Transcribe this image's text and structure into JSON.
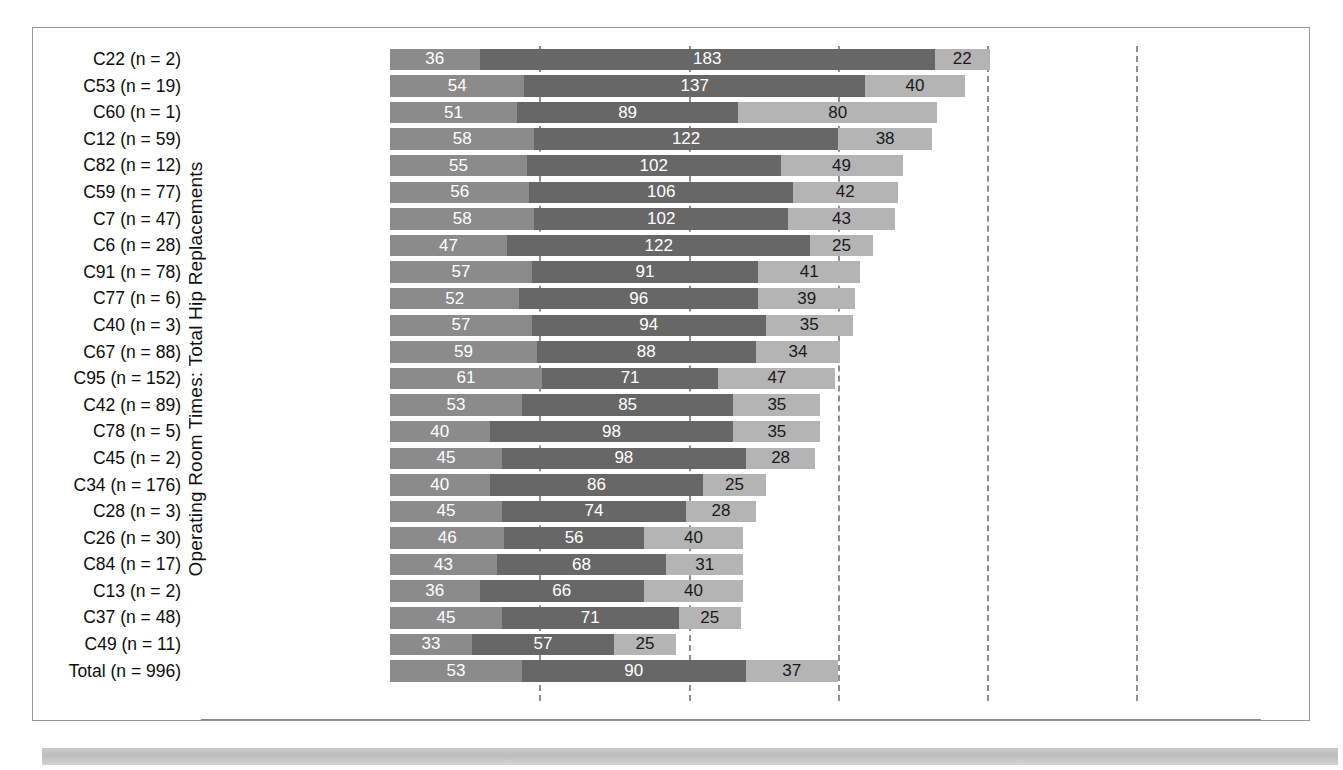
{
  "figure": {
    "axis_title": "Operating Room Times: Total Hip Replacements"
  },
  "chart_data": {
    "type": "bar",
    "orientation": "horizontal",
    "stacked": true,
    "title": "",
    "xlabel": "",
    "ylabel": "Operating Room Times: Total Hip Replacements",
    "xlim": [
      0,
      360
    ],
    "grid": true,
    "gridlines_x": [
      60,
      120,
      180,
      240,
      300
    ],
    "legend_position": "none",
    "series": [
      {
        "name": "segment-1",
        "color": "#8b8b8b"
      },
      {
        "name": "segment-2",
        "color": "#676767"
      },
      {
        "name": "segment-3",
        "color": "#b4b4b4"
      }
    ],
    "categories": [
      "C22 (n = 2)",
      "C53 (n = 19)",
      "C60 (n = 1)",
      "C12 (n = 59)",
      "C82 (n = 12)",
      "C59 (n = 77)",
      "C7 (n = 47)",
      "C6 (n = 28)",
      "C91 (n = 78)",
      "C77 (n = 6)",
      "C40 (n = 3)",
      "C67 (n = 88)",
      "C95 (n = 152)",
      "C42 (n = 89)",
      "C78 (n = 5)",
      "C45 (n = 2)",
      "C34 (n = 176)",
      "C28 (n = 3)",
      "C26 (n = 30)",
      "C84 (n = 17)",
      "C13 (n = 2)",
      "C37 (n = 48)",
      "C49 (n = 11)",
      "Total (n = 996)"
    ],
    "rows": [
      {
        "label": "C22 (n = 2)",
        "values": [
          36,
          183,
          22
        ],
        "total": 241
      },
      {
        "label": "C53 (n = 19)",
        "values": [
          54,
          137,
          40
        ],
        "total": 231
      },
      {
        "label": "C60 (n = 1)",
        "values": [
          51,
          89,
          80
        ],
        "total": 220
      },
      {
        "label": "C12 (n = 59)",
        "values": [
          58,
          122,
          38
        ],
        "total": 218
      },
      {
        "label": "C82 (n = 12)",
        "values": [
          55,
          102,
          49
        ],
        "total": 206
      },
      {
        "label": "C59 (n = 77)",
        "values": [
          56,
          106,
          42
        ],
        "total": 204
      },
      {
        "label": "C7 (n = 47)",
        "values": [
          58,
          102,
          43
        ],
        "total": 203
      },
      {
        "label": "C6 (n = 28)",
        "values": [
          47,
          122,
          25
        ],
        "total": 194
      },
      {
        "label": "C91 (n = 78)",
        "values": [
          57,
          91,
          41
        ],
        "total": 189
      },
      {
        "label": "C77 (n = 6)",
        "values": [
          52,
          96,
          39
        ],
        "total": 187
      },
      {
        "label": "C40 (n = 3)",
        "values": [
          57,
          94,
          35
        ],
        "total": 186
      },
      {
        "label": "C67 (n = 88)",
        "values": [
          59,
          88,
          34
        ],
        "total": 181
      },
      {
        "label": "C95 (n = 152)",
        "values": [
          61,
          71,
          47
        ],
        "total": 179
      },
      {
        "label": "C42 (n = 89)",
        "values": [
          53,
          85,
          35
        ],
        "total": 173
      },
      {
        "label": "C78 (n = 5)",
        "values": [
          40,
          98,
          35
        ],
        "total": 173
      },
      {
        "label": "C45 (n = 2)",
        "values": [
          45,
          98,
          28
        ],
        "total": 171
      },
      {
        "label": "C34 (n = 176)",
        "values": [
          40,
          86,
          25
        ],
        "total": 151
      },
      {
        "label": "C28 (n = 3)",
        "values": [
          45,
          74,
          28
        ],
        "total": 147
      },
      {
        "label": "C26 (n = 30)",
        "values": [
          46,
          56,
          40
        ],
        "total": 142
      },
      {
        "label": "C84 (n = 17)",
        "values": [
          43,
          68,
          31
        ],
        "total": 142
      },
      {
        "label": "C13 (n = 2)",
        "values": [
          36,
          66,
          40
        ],
        "total": 142
      },
      {
        "label": "C37 (n = 48)",
        "values": [
          45,
          71,
          25
        ],
        "total": 141
      },
      {
        "label": "C49 (n = 11)",
        "values": [
          33,
          57,
          25
        ],
        "total": 115
      },
      {
        "label": "Total (n = 996)",
        "values": [
          53,
          90,
          37
        ],
        "total": 180
      }
    ]
  }
}
